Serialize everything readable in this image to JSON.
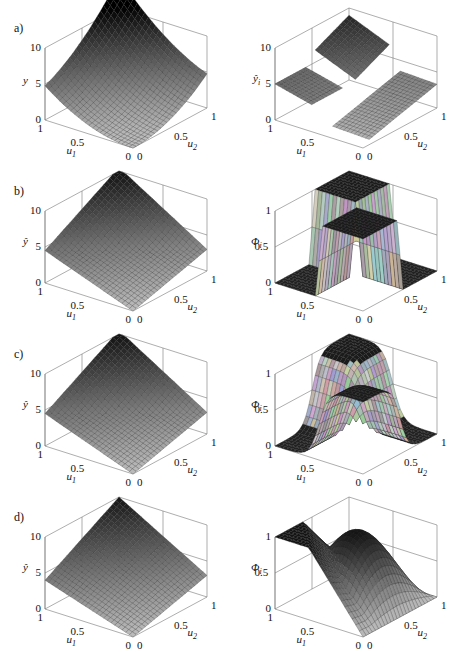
{
  "figure": {
    "rows": [
      {
        "label": "a)",
        "left": {
          "zlabel": "y",
          "ticks_z": [
            "10",
            "5",
            "0"
          ],
          "ticks_u1": [
            "1",
            "0.5",
            "0"
          ],
          "ticks_u2": [
            "0",
            "0.5",
            "1"
          ],
          "xlabel": "u1",
          "ylabel": "u2"
        },
        "right": {
          "zlabel": "ŷi",
          "ticks_z": [
            "10",
            "5",
            "0"
          ],
          "ticks_u1": [
            "1",
            "0.5",
            "0"
          ],
          "ticks_u2": [
            "0",
            "0.5",
            "1"
          ],
          "xlabel": "u1",
          "ylabel": "u2"
        }
      },
      {
        "label": "b)",
        "left": {
          "zlabel": "ŷ",
          "ticks_z": [
            "10",
            "5",
            "0"
          ],
          "ticks_u1": [
            "1",
            "0.5",
            "0"
          ],
          "ticks_u2": [
            "0",
            "0.5",
            "1"
          ],
          "xlabel": "u1",
          "ylabel": "u2"
        },
        "right": {
          "zlabel": "Φi",
          "ticks_z": [
            "1",
            "0.5",
            "0"
          ],
          "ticks_u1": [
            "1",
            "0.5",
            "0"
          ],
          "ticks_u2": [
            "0",
            "0.5",
            "1"
          ],
          "xlabel": "u1",
          "ylabel": "u2"
        }
      },
      {
        "label": "c)",
        "left": {
          "zlabel": "ŷ",
          "ticks_z": [
            "10",
            "5",
            "0"
          ],
          "ticks_u1": [
            "1",
            "0.5",
            "0"
          ],
          "ticks_u2": [
            "0",
            "0.5",
            "1"
          ],
          "xlabel": "u1",
          "ylabel": "u2"
        },
        "right": {
          "zlabel": "Φi",
          "ticks_z": [
            "1",
            "0.5",
            "0"
          ],
          "ticks_u1": [
            "1",
            "0.5",
            "0"
          ],
          "ticks_u2": [
            "0",
            "0.5",
            "1"
          ],
          "xlabel": "u1",
          "ylabel": "u2"
        }
      },
      {
        "label": "d)",
        "left": {
          "zlabel": "ŷ",
          "ticks_z": [
            "10",
            "5",
            "0"
          ],
          "ticks_u1": [
            "1",
            "0.5",
            "0"
          ],
          "ticks_u2": [
            "0",
            "0.5",
            "1"
          ],
          "xlabel": "u1",
          "ylabel": "u2"
        },
        "right": {
          "zlabel": "Φi",
          "ticks_z": [
            "1",
            "0.5",
            "0"
          ],
          "ticks_u1": [
            "1",
            "0.5",
            "0"
          ],
          "ticks_u2": [
            "0",
            "0.5",
            "1"
          ],
          "xlabel": "u1",
          "ylabel": "u2"
        }
      }
    ]
  },
  "chart_data": [
    {
      "panel": "a-left",
      "type": "surface",
      "title": "",
      "xlabel": "u1",
      "ylabel": "u2",
      "zlabel": "y",
      "xlim": [
        0,
        1
      ],
      "ylim": [
        0,
        1
      ],
      "zlim": [
        0,
        10
      ],
      "corner_values": {
        "u1=0,u2=0": 0,
        "u1=1,u2=0": 5,
        "u1=0,u2=1": 5,
        "u1=1,u2=1": 10
      },
      "shape": "convex bowl"
    },
    {
      "panel": "a-right",
      "type": "surface",
      "xlabel": "u1",
      "ylabel": "u2",
      "zlabel": "ŷi",
      "xlim": [
        0,
        1
      ],
      "ylim": [
        0,
        1
      ],
      "zlim": [
        0,
        10
      ],
      "description": "three local linear planes (piecewise models)"
    },
    {
      "panel": "b-left",
      "type": "surface",
      "xlabel": "u1",
      "ylabel": "u2",
      "zlabel": "ŷ",
      "xlim": [
        0,
        1
      ],
      "ylim": [
        0,
        1
      ],
      "zlim": [
        0,
        10
      ],
      "corner_values": {
        "u1=0,u2=0": 0,
        "u1=1,u2=0": 4.5,
        "u1=0,u2=1": 3,
        "u1=1,u2=1": 10
      }
    },
    {
      "panel": "b-right",
      "type": "surface",
      "xlabel": "u1",
      "ylabel": "u2",
      "zlabel": "Φi",
      "xlim": [
        0,
        1
      ],
      "ylim": [
        0,
        1
      ],
      "zlim": [
        0,
        1
      ],
      "description": "crisp (step-like) validity functions"
    },
    {
      "panel": "c-left",
      "type": "surface",
      "xlabel": "u1",
      "ylabel": "u2",
      "zlabel": "ŷ",
      "xlim": [
        0,
        1
      ],
      "ylim": [
        0,
        1
      ],
      "zlim": [
        0,
        10
      ],
      "corner_values": {
        "u1=0,u2=0": 0,
        "u1=1,u2=0": 4.5,
        "u1=0,u2=1": 3,
        "u1=1,u2=1": 10
      }
    },
    {
      "panel": "c-right",
      "type": "surface",
      "xlabel": "u1",
      "ylabel": "u2",
      "zlabel": "Φi",
      "xlim": [
        0,
        1
      ],
      "ylim": [
        0,
        1
      ],
      "zlim": [
        0,
        1
      ],
      "description": "smooth sigmoid-like validity functions"
    },
    {
      "panel": "d-left",
      "type": "surface",
      "xlabel": "u1",
      "ylabel": "u2",
      "zlabel": "ŷ",
      "xlim": [
        0,
        1
      ],
      "ylim": [
        0,
        1
      ],
      "zlim": [
        0,
        10
      ],
      "corner_values": {
        "u1=0,u2=0": 0,
        "u1=1,u2=0": 4,
        "u1=0,u2=1": 3,
        "u1=1,u2=1": 10
      }
    },
    {
      "panel": "d-right",
      "type": "surface",
      "xlabel": "u1",
      "ylabel": "u2",
      "zlabel": "Φi",
      "xlim": [
        0,
        1
      ],
      "ylim": [
        0,
        1
      ],
      "zlim": [
        0,
        1
      ],
      "description": "very smooth overlapping validity functions"
    }
  ]
}
